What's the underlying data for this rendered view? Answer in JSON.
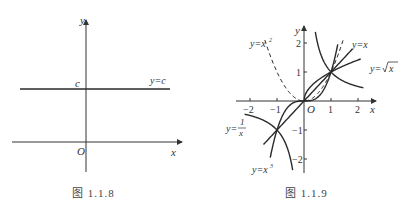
{
  "chart_data": [
    {
      "type": "line",
      "caption": "图 1.1.8",
      "title": "",
      "xlabel": "x",
      "ylabel": "y",
      "origin_label": "O",
      "series": [
        {
          "name": "y=c",
          "label": "y=c",
          "kind": "constant",
          "y_label": "c",
          "style": "solid"
        }
      ],
      "grid": false
    },
    {
      "type": "line",
      "caption": "图 1.1.9",
      "title": "",
      "xlabel": "x",
      "ylabel": "y",
      "origin_label": "O",
      "xlim": [
        -2.3,
        2.3
      ],
      "ylim": [
        -2.5,
        2.5
      ],
      "x_ticks": [
        -2,
        -1,
        1,
        2
      ],
      "x_tick_labels": [
        "−2",
        "−1",
        "1",
        "2"
      ],
      "y_ticks": [
        -2,
        -1,
        1,
        2
      ],
      "y_tick_labels": [
        "−2",
        "−1",
        "1",
        "2"
      ],
      "grid": false,
      "series": [
        {
          "name": "y=x",
          "label": "y=x",
          "func": "x",
          "domain": [
            -1.5,
            1.8
          ],
          "style": "solid"
        },
        {
          "name": "y=sqrt(x)",
          "label": "y=√x",
          "func": "sqrt",
          "domain": [
            0,
            2.1
          ],
          "style": "solid"
        },
        {
          "name": "y=x^2",
          "label": "y=x²",
          "func": "square",
          "domain": [
            -1.45,
            1.45
          ],
          "style": "dashed"
        },
        {
          "name": "y=x^3",
          "label": "y=x³",
          "func": "cube",
          "domain": [
            -1.25,
            1.25
          ],
          "style": "solid"
        },
        {
          "name": "y=1/x",
          "label": "y=1/x",
          "func": "recip",
          "domain_pos": [
            0.42,
            2.2
          ],
          "domain_neg": [
            -2.2,
            -0.42
          ],
          "style": "solid"
        }
      ],
      "intersections": [
        [
          0,
          0
        ],
        [
          1,
          1
        ],
        [
          -1,
          -1
        ]
      ]
    }
  ],
  "labels": {
    "fig8_caption": "图  1.1.8",
    "fig9_caption": "图  1.1.9",
    "y": "y",
    "x": "x",
    "O": "O",
    "c": "c",
    "yc": "y=c",
    "yx": "y=x",
    "ysqrt_prefix": "y=",
    "ysqrt_arg": "x",
    "yx2": "y=x",
    "yx2_sup": "2",
    "yx3": "y=x",
    "yx3_sup": "3",
    "yrecip_prefix": "y=",
    "yrecip_num": "1",
    "yrecip_den": "x"
  }
}
